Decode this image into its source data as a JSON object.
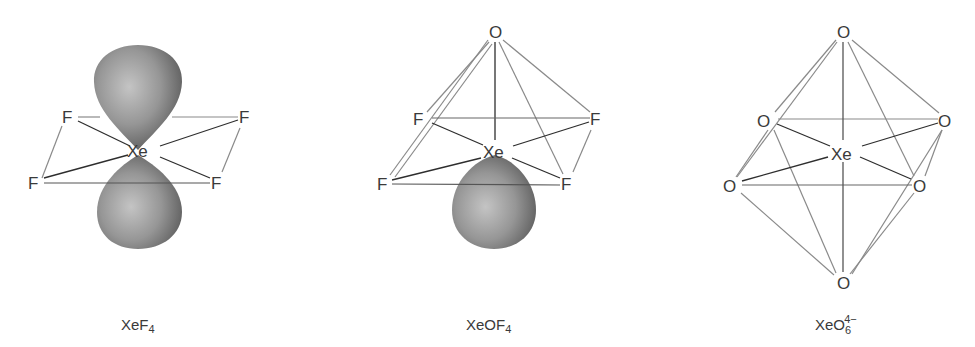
{
  "figure": {
    "panels": [
      {
        "id": "xef4",
        "caption": {
          "base": "XeF",
          "subscript": "4",
          "superscript": ""
        },
        "central_atom": "Xe",
        "ligands": [
          "F",
          "F",
          "F",
          "F"
        ],
        "lone_pairs": 2,
        "geometry": "square planar"
      },
      {
        "id": "xeof4",
        "caption": {
          "base": "XeOF",
          "subscript": "4",
          "superscript": ""
        },
        "central_atom": "Xe",
        "ligands": [
          "O",
          "F",
          "F",
          "F",
          "F"
        ],
        "lone_pairs": 1,
        "geometry": "square pyramidal"
      },
      {
        "id": "xeo6",
        "caption": {
          "base": "XeO",
          "subscript": "6",
          "superscript": "4−"
        },
        "central_atom": "Xe",
        "ligands": [
          "O",
          "O",
          "O",
          "O",
          "O",
          "O"
        ],
        "lone_pairs": 0,
        "geometry": "octahedral"
      }
    ],
    "colors": {
      "lobe_dark": "#5a5a5a",
      "lobe_light": "#bdbdbd",
      "bond_dark": "#2e2e2e",
      "bond_light": "#8a8a8a",
      "text": "#3a3a3a"
    }
  }
}
